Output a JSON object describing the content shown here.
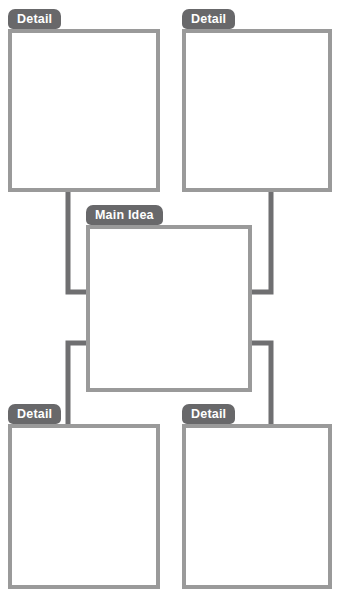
{
  "organizer": {
    "title": "Main Idea and Details Graphic Organizer",
    "canvas": {
      "width": 340,
      "height": 598
    },
    "colors": {
      "tab_fill": "#68686a",
      "tab_text": "#ffffff",
      "box_border": "#9a9a9a",
      "box_fill": "#ffffff",
      "connector": "#6f6f71",
      "background": "#ffffff"
    },
    "center_node": {
      "label": "Main Idea",
      "content": "",
      "placeholder": ""
    },
    "detail_nodes": [
      {
        "label": "Detail",
        "content": "",
        "placeholder": "",
        "position": "top-left"
      },
      {
        "label": "Detail",
        "content": "",
        "placeholder": "",
        "position": "top-right"
      },
      {
        "label": "Detail",
        "content": "",
        "placeholder": "",
        "position": "bottom-left"
      },
      {
        "label": "Detail",
        "content": "",
        "placeholder": "",
        "position": "bottom-right"
      }
    ],
    "connectors": [
      {
        "from": "top-left",
        "to": "main-idea",
        "style": "elbow"
      },
      {
        "from": "top-right",
        "to": "main-idea",
        "style": "elbow"
      },
      {
        "from": "main-idea",
        "to": "bottom-left",
        "style": "elbow"
      },
      {
        "from": "main-idea",
        "to": "bottom-right",
        "style": "elbow"
      }
    ]
  }
}
